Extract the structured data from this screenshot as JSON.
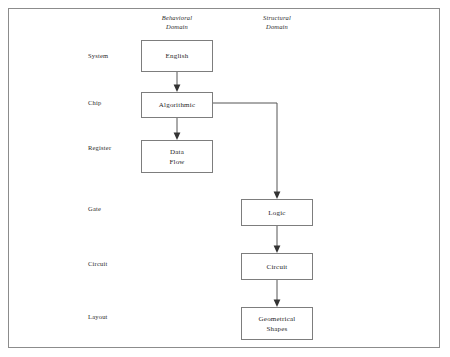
{
  "diagram": {
    "frame": {
      "border_color": "#8c8c8c",
      "background": "#ffffff"
    },
    "columns": [
      {
        "id": "behavioral",
        "line1": "Behavioral",
        "line2": "Domain"
      },
      {
        "id": "structural",
        "line1": "Structural",
        "line2": "Domain"
      }
    ],
    "rows": [
      {
        "id": "system",
        "label": "System"
      },
      {
        "id": "chip",
        "label": "Chip"
      },
      {
        "id": "register",
        "label": "Register"
      },
      {
        "id": "gate",
        "label": "Gate"
      },
      {
        "id": "circuit",
        "label": "Circuit"
      },
      {
        "id": "layout",
        "label": "Layout"
      }
    ],
    "nodes": [
      {
        "id": "english",
        "line1": "English",
        "line2": ""
      },
      {
        "id": "algorithmic",
        "line1": "Algorithmic",
        "line2": ""
      },
      {
        "id": "data-flow",
        "line1": "Data",
        "line2": "Flow"
      },
      {
        "id": "logic",
        "line1": "Logic",
        "line2": ""
      },
      {
        "id": "circuit-node",
        "line1": "Circuit",
        "line2": ""
      },
      {
        "id": "geometrical-shapes",
        "line1": "Geometrical",
        "line2": "Shapes"
      }
    ],
    "edges": [
      {
        "id": "english-to-algorithmic",
        "from": "english",
        "to": "algorithmic",
        "kind": "straight-down"
      },
      {
        "id": "algorithmic-to-data-flow",
        "from": "algorithmic",
        "to": "data-flow",
        "kind": "straight-down"
      },
      {
        "id": "algorithmic-to-logic",
        "from": "algorithmic",
        "to": "logic",
        "kind": "elbow-right-down"
      },
      {
        "id": "logic-to-circuit",
        "from": "logic",
        "to": "circuit-node",
        "kind": "straight-down"
      },
      {
        "id": "circuit-to-geometrical-shapes",
        "from": "circuit-node",
        "to": "geometrical-shapes",
        "kind": "straight-down"
      }
    ],
    "colors": {
      "line": "#555555",
      "node_border": "#7d7d7d",
      "text": "#1f1f1f"
    }
  }
}
